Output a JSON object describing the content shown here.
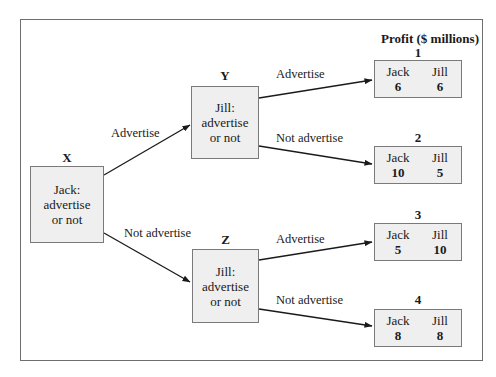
{
  "title": "Profit ($ millions)",
  "decision_nodes": [
    {
      "id": "X",
      "lines": [
        "Jack:",
        "advertise",
        "or not"
      ]
    },
    {
      "id": "Y",
      "lines": [
        "Jill:",
        "advertise",
        "or not"
      ]
    },
    {
      "id": "Z",
      "lines": [
        "Jill:",
        "advertise",
        "or not"
      ]
    }
  ],
  "edges": [
    {
      "from": "X",
      "to": "Y",
      "label": "Advertise"
    },
    {
      "from": "X",
      "to": "Z",
      "label": "Not advertise"
    },
    {
      "from": "Y",
      "to": "1",
      "label": "Advertise"
    },
    {
      "from": "Y",
      "to": "2",
      "label": "Not advertise"
    },
    {
      "from": "Z",
      "to": "3",
      "label": "Advertise"
    },
    {
      "from": "Z",
      "to": "4",
      "label": "Not advertise"
    }
  ],
  "outcomes": [
    {
      "id": "1",
      "player1": "Jack",
      "value1": "6",
      "player2": "Jill",
      "value2": "6"
    },
    {
      "id": "2",
      "player1": "Jack",
      "value1": "10",
      "player2": "Jill",
      "value2": "5"
    },
    {
      "id": "3",
      "player1": "Jack",
      "value1": "5",
      "player2": "Jill",
      "value2": "10"
    },
    {
      "id": "4",
      "player1": "Jack",
      "value1": "8",
      "player2": "Jill",
      "value2": "8"
    }
  ]
}
